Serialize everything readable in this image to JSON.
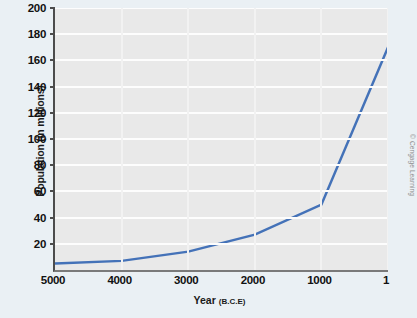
{
  "chart_data": {
    "type": "line",
    "title": "",
    "subtitle": "",
    "xlabel": "Year (B.C.E)",
    "xlabel_main": "Year",
    "xlabel_suffix": "(B.C.E)",
    "ylabel": "Population (in millions)",
    "x": [
      5000,
      4000,
      3000,
      2000,
      1000,
      1
    ],
    "xtick_labels": [
      "5000",
      "4000",
      "3000",
      "2000",
      "1000",
      "1"
    ],
    "ytick_labels": [
      "0",
      "20",
      "40",
      "60",
      "80",
      "100",
      "120",
      "140",
      "160",
      "180",
      "200"
    ],
    "yticks": [
      0,
      20,
      40,
      60,
      80,
      100,
      120,
      140,
      160,
      180,
      200
    ],
    "series": [
      {
        "name": "World population",
        "values": [
          5,
          7,
          14,
          27,
          50,
          170
        ],
        "color": "#4472b8"
      }
    ],
    "xlim": [
      5000,
      1
    ],
    "ylim": [
      0,
      200
    ],
    "x_axis_reversed": true,
    "grid": "horizontal-major",
    "legend": "none",
    "plot_background": "#e9e9e9",
    "gridline_color": "#fdfdfd",
    "page_background": "#eaf0f4"
  },
  "credit": {
    "text": "© Cengage Learning"
  }
}
